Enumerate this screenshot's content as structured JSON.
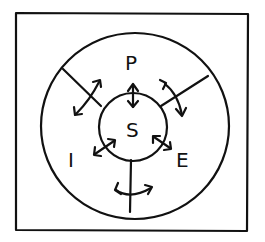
{
  "diagram": {
    "center": {
      "label": "S"
    },
    "outer_labels": [
      {
        "id": "top",
        "label": "P"
      },
      {
        "id": "left",
        "label": "I"
      },
      {
        "id": "right",
        "label": "E"
      }
    ],
    "colors": {
      "stroke": "#111111",
      "background": "#ffffff"
    }
  }
}
